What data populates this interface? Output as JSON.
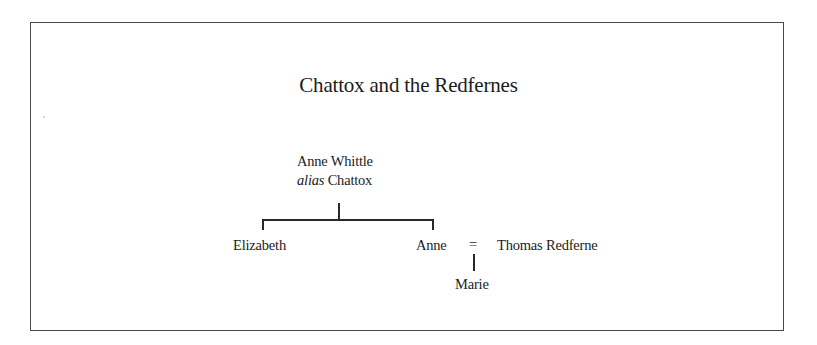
{
  "diagram": {
    "type": "family-tree",
    "title": "Chattox and the Redfernes",
    "nodes": {
      "root": {
        "name": "Anne Whittle",
        "alias_prefix": "alias",
        "alias_name": "Chattox"
      },
      "child_1": {
        "name": "Elizabeth"
      },
      "child_2": {
        "name": "Anne"
      },
      "spouse": {
        "name": "Thomas Redferne"
      },
      "grandchild": {
        "name": "Marie"
      }
    },
    "marriage_symbol": "=",
    "relations": [
      {
        "from": "Anne Whittle alias Chattox",
        "to": "Elizabeth",
        "type": "parent-child"
      },
      {
        "from": "Anne Whittle alias Chattox",
        "to": "Anne",
        "type": "parent-child"
      },
      {
        "from": "Anne",
        "to": "Thomas Redferne",
        "type": "marriage"
      },
      {
        "from": "Anne = Thomas Redferne",
        "to": "Marie",
        "type": "parent-child"
      }
    ],
    "colors": {
      "text": "#1c1c1c",
      "lines": "#2a2a2a",
      "frame": "#4a4a4a",
      "background": "#ffffff"
    }
  }
}
